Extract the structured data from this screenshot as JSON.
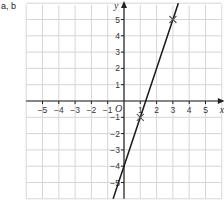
{
  "question_label": "a, b",
  "chart_data": {
    "type": "line",
    "title": "",
    "xlabel": "x",
    "ylabel": "y",
    "origin_label": "O",
    "xlim": [
      -6,
      6
    ],
    "ylim": [
      -6,
      6
    ],
    "grid": true,
    "x_ticks": [
      -5,
      -4,
      -3,
      -2,
      -1,
      1,
      2,
      3,
      4,
      5
    ],
    "y_ticks": [
      -5,
      -4,
      -3,
      -2,
      -1,
      1,
      2,
      3,
      4,
      5
    ],
    "series": [
      {
        "name": "y = 3x - 4",
        "slope": 3,
        "intercept": -4,
        "x": [
          -0.667,
          3.333
        ],
        "y": [
          -6,
          6
        ]
      }
    ],
    "marked_points": [
      {
        "x": 1,
        "y": -1,
        "marker": "cross"
      },
      {
        "x": 3,
        "y": 5,
        "marker": "cross"
      }
    ]
  }
}
